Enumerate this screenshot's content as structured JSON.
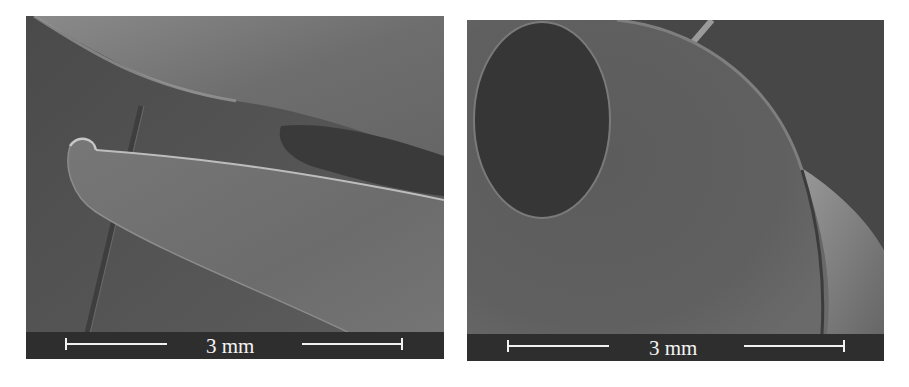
{
  "figure": {
    "panels": [
      {
        "id": "left",
        "description": "SEM micrograph of a curled needle/blade tip with an elongated dark slot",
        "scale_bar": {
          "label": "3 mm",
          "length_mm": 3
        }
      },
      {
        "id": "right",
        "description": "SEM micrograph of a domed tip with a circular dark opening",
        "scale_bar": {
          "label": "3 mm",
          "length_mm": 3
        }
      }
    ],
    "colors": {
      "background": "#ffffff",
      "scale_strip": "#2e2e2e",
      "scale_text": "#f4f4f4",
      "sem_gray": "#5a5a5a"
    }
  }
}
